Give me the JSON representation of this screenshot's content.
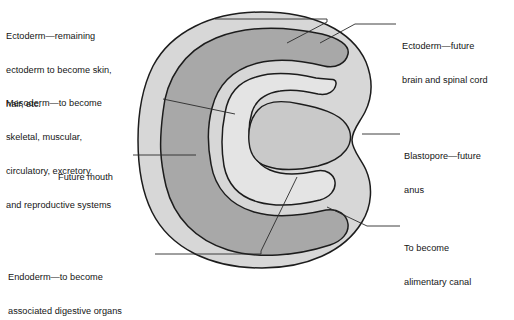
{
  "figure": {
    "colors": {
      "background": "#ffffff",
      "outline": "#1c1c1c",
      "ectoderm": "#d7d7d7",
      "mesoderm": "#a8a8a8",
      "archenteron": "#e4e4e4",
      "endoderm": "#c9c9c9",
      "leader_line": "#2a2a2a",
      "text": "#151515"
    }
  },
  "labels": {
    "ectoderm_outer": {
      "lines": [
        "Ectoderm—remaining",
        "ectoderm to become skin,",
        "hair, etc."
      ]
    },
    "mesoderm": {
      "lines": [
        "Mesoderm—to become",
        "skeletal, muscular,",
        "circulatory, excretory,",
        "and reproductive systems"
      ]
    },
    "future_mouth": {
      "lines": [
        "Future mouth"
      ]
    },
    "endoderm": {
      "lines": [
        "Endoderm—to become",
        "associated digestive organs"
      ]
    },
    "ectoderm_neural": {
      "lines": [
        "Ectoderm—future",
        "brain and spinal cord"
      ]
    },
    "blastopore": {
      "lines": [
        "Blastopore—future",
        "anus"
      ]
    },
    "alimentary_canal": {
      "lines": [
        "To become",
        "alimentary canal"
      ]
    }
  }
}
